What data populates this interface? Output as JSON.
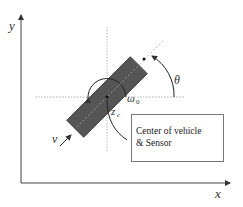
{
  "diagram": {
    "axes": {
      "x_label": "x",
      "y_label": "y"
    },
    "labels": {
      "theta": "θ",
      "omega": "ω",
      "omega_sub": "0",
      "z": "z",
      "z_sub": "c",
      "v": "v"
    },
    "callout": {
      "line1": "Center of vehicle",
      "line2": "& Sensor"
    },
    "colors": {
      "vehicle_fill": "#555555",
      "axis": "#444444",
      "dotted": "#999999"
    }
  }
}
